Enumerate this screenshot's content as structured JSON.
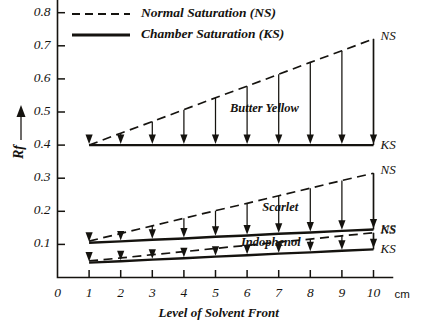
{
  "chart_data": {
    "type": "line",
    "title": "",
    "xlabel": "Level of Solvent Front",
    "ylabel": "Rf",
    "x_unit": "cm",
    "xlim": [
      0,
      10.6
    ],
    "ylim": [
      0,
      0.84
    ],
    "xticks": [
      "0",
      "1",
      "2",
      "3",
      "4",
      "5",
      "6",
      "7",
      "8",
      "9",
      "10"
    ],
    "yticks": [
      "0.1",
      "0.2",
      "0.3",
      "0.4",
      "0.5",
      "0.6",
      "0.7",
      "0.8"
    ],
    "grid": false,
    "legend_position": "top-left",
    "legend": [
      {
        "label": "Normal Saturation (NS)",
        "style": "dashed"
      },
      {
        "label": "Chamber Saturation (KS)",
        "style": "solid"
      }
    ],
    "x": [
      1,
      2,
      3,
      4,
      5,
      6,
      7,
      8,
      9,
      10
    ],
    "groups": [
      {
        "name": "Butter Yellow",
        "annotation": "Butter Yellow",
        "series": [
          {
            "name": "NS",
            "style": "dashed",
            "end_label": "NS",
            "values": [
              0.4,
              0.436,
              0.471,
              0.507,
              0.543,
              0.578,
              0.614,
              0.65,
              0.685,
              0.721
            ]
          },
          {
            "name": "KS",
            "style": "solid",
            "end_label": "KS",
            "values": [
              0.4,
              0.4,
              0.4,
              0.4,
              0.4,
              0.4,
              0.4,
              0.4,
              0.4,
              0.4
            ]
          }
        ]
      },
      {
        "name": "Scarlet",
        "annotation": "Scarlet",
        "series": [
          {
            "name": "NS",
            "style": "dashed",
            "end_label": "NS",
            "values": [
              0.11,
              0.133,
              0.156,
              0.179,
              0.202,
              0.224,
              0.247,
              0.27,
              0.293,
              0.315
            ]
          },
          {
            "name": "KS",
            "style": "solid",
            "end_label": "KS",
            "values": [
              0.105,
              0.109,
              0.114,
              0.118,
              0.123,
              0.127,
              0.132,
              0.136,
              0.141,
              0.145
            ]
          }
        ]
      },
      {
        "name": "Indophenol",
        "annotation": "Indophenol",
        "series": [
          {
            "name": "NS",
            "style": "dashed",
            "end_label": "NS",
            "values": [
              0.05,
              0.059,
              0.069,
              0.078,
              0.088,
              0.097,
              0.107,
              0.116,
              0.126,
              0.135
            ]
          },
          {
            "name": "KS",
            "style": "solid",
            "end_label": "KS",
            "values": [
              0.045,
              0.049,
              0.054,
              0.058,
              0.063,
              0.067,
              0.072,
              0.076,
              0.081,
              0.085
            ]
          }
        ]
      }
    ],
    "colors": {
      "ink": "#15130f",
      "background": "#ffffff"
    }
  }
}
